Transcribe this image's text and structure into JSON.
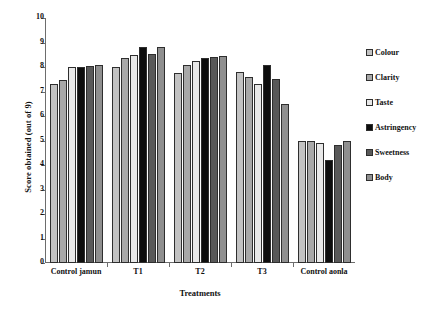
{
  "chart_data": {
    "type": "bar",
    "title": "",
    "xlabel": "Treatments",
    "ylabel": "Score obtained (out of 9)",
    "categories": [
      "Control jamun",
      "T1",
      "T2",
      "T3",
      "Control aonla"
    ],
    "ylim": [
      0,
      10
    ],
    "yticks": [
      0,
      1,
      2,
      3,
      4,
      5,
      6,
      7,
      8,
      9,
      10
    ],
    "grid": false,
    "legend_position": "right",
    "series": [
      {
        "name": "Colour",
        "color": "#c2c2c2",
        "values": [
          7.3,
          8.0,
          7.75,
          7.8,
          5.0
        ]
      },
      {
        "name": "Clarity",
        "color": "#a8a8a8",
        "values": [
          7.45,
          8.35,
          8.1,
          7.6,
          5.0
        ]
      },
      {
        "name": "Taste",
        "color": "#e8e8e8",
        "values": [
          8.0,
          8.5,
          8.25,
          7.3,
          4.9
        ]
      },
      {
        "name": "Astringency",
        "color": "#0d0d0d",
        "values": [
          8.0,
          8.8,
          8.35,
          8.1,
          4.2
        ]
      },
      {
        "name": "Sweetness",
        "color": "#595959",
        "values": [
          8.05,
          8.55,
          8.4,
          7.5,
          4.8
        ]
      },
      {
        "name": "Body",
        "color": "#8f8f8f",
        "values": [
          8.1,
          8.8,
          8.45,
          6.5,
          5.0
        ]
      }
    ]
  }
}
